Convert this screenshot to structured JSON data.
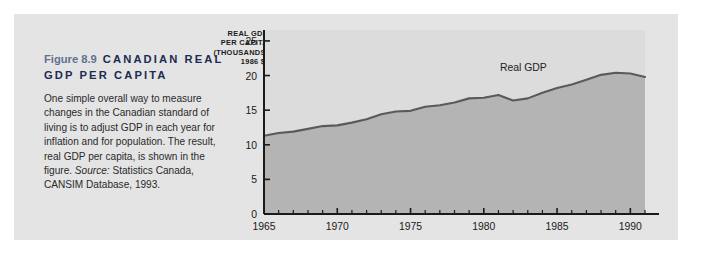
{
  "figure": {
    "number": "Figure 8.9",
    "title": "CANADIAN REAL GDP PER CAPITA",
    "caption": "One simple overall way to measure changes in the Canadian standard of living is to adjust GDP in each year for inflation and for population. The result, real GDP per capita, is shown in the figure. ",
    "source_label": "Source:",
    "source_text": " Statistics Canada, CANSIM Database, 1993."
  },
  "colors": {
    "panel_background": "#e4e4e4",
    "plot_background": "#dcdcdc",
    "area_fill": "#b4b4b4",
    "line": "#5a5a5a",
    "axis": "#1a1a1a",
    "heading": "#1b2b52",
    "figure_number": "#5f7190"
  },
  "chart_data": {
    "type": "area",
    "title": "",
    "xlabel": "",
    "ylabel": "REAL GDP PER CAPITA (THOUSANDS, 1986 $)",
    "ylabel_lines": [
      "REAL GDP",
      "PER CAPITA",
      "(THOUSANDS,",
      "1986 $)"
    ],
    "series_annotation": "Real GDP",
    "legend_position": "inline-annotation",
    "grid": false,
    "xlim": [
      1965,
      1991
    ],
    "ylim": [
      0,
      26
    ],
    "ytick_values": [
      0,
      5,
      10,
      15,
      20,
      25
    ],
    "ytick_labels": [
      "0",
      "5",
      "10",
      "15",
      "20",
      "25"
    ],
    "xtick_major_values": [
      1965,
      1970,
      1975,
      1980,
      1985,
      1990
    ],
    "xtick_major_labels": [
      "1965",
      "1970",
      "1975",
      "1980",
      "1985",
      "1990"
    ],
    "xtick_minor_step": 1,
    "x": [
      1965,
      1966,
      1967,
      1968,
      1969,
      1970,
      1971,
      1972,
      1973,
      1974,
      1975,
      1976,
      1977,
      1978,
      1979,
      1980,
      1981,
      1982,
      1983,
      1984,
      1985,
      1986,
      1987,
      1988,
      1989,
      1990,
      1991
    ],
    "values": [
      11.3,
      11.7,
      11.9,
      12.3,
      12.7,
      12.8,
      13.2,
      13.7,
      14.4,
      14.8,
      14.9,
      15.5,
      15.7,
      16.1,
      16.7,
      16.8,
      17.2,
      16.4,
      16.7,
      17.5,
      18.2,
      18.7,
      19.4,
      20.1,
      20.4,
      20.3,
      19.8
    ],
    "series": [
      {
        "name": "Real GDP",
        "values": [
          11.3,
          11.7,
          11.9,
          12.3,
          12.7,
          12.8,
          13.2,
          13.7,
          14.4,
          14.8,
          14.9,
          15.5,
          15.7,
          16.1,
          16.7,
          16.8,
          17.2,
          16.4,
          16.7,
          17.5,
          18.2,
          18.7,
          19.4,
          20.1,
          20.4,
          20.3,
          19.8
        ]
      }
    ]
  }
}
